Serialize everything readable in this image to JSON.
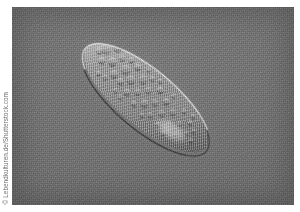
{
  "page": {
    "kind": "photograph",
    "background_color": "#ffffff",
    "width": 300,
    "height": 212
  },
  "attribution": {
    "text": "© Lebendkulturen.de/Shutterstock.com",
    "symbol": "©",
    "author": "Lebendkulturen.de",
    "agency": "Shutterstock.com",
    "orientation": "vertical-rotated-90-ccw",
    "color": "#6b6b6b",
    "position": "left-margin"
  },
  "photo": {
    "subject": "paramecium",
    "technique": "differential-interference-contrast-microscopy",
    "frame": {
      "x": 12,
      "y": 7,
      "width": 282,
      "height": 198
    },
    "background_color": "#6f6f6f",
    "highlight_color": "#ffffff",
    "shadow_color": "#141414",
    "organism": {
      "shape": "elongated-ellipse",
      "center_x": 146,
      "center_y": 98,
      "length": 156,
      "width": 56,
      "rotation_degrees": 40,
      "body_color": "#9a9a9a",
      "anterior": "upper-left-pointed",
      "posterior": "lower-right-rounded",
      "features": [
        "bright-membrane-rim-upper-left",
        "dark-membrane-rim-lower-right",
        "granular-cytoplasm",
        "numerous-vacuoles",
        "large-pale-food-vacuole"
      ]
    }
  },
  "vacuoles": [
    {
      "x": 16,
      "y": 16,
      "d": 9.5
    },
    {
      "x": 24,
      "y": 8,
      "d": 7.5
    },
    {
      "x": 29,
      "y": 22,
      "d": 8.5
    },
    {
      "x": 34,
      "y": 13,
      "d": 6.0
    },
    {
      "x": 38,
      "y": 30,
      "d": 7.0
    },
    {
      "x": 20,
      "y": 28,
      "d": 6.5
    },
    {
      "x": 44,
      "y": 19,
      "d": 9.0
    },
    {
      "x": 48,
      "y": 32,
      "d": 5.5
    },
    {
      "x": 52,
      "y": 10,
      "d": 6.5
    },
    {
      "x": 55,
      "y": 24,
      "d": 7.5
    },
    {
      "x": 60,
      "y": 36,
      "d": 6.0
    },
    {
      "x": 64,
      "y": 16,
      "d": 8.0
    },
    {
      "x": 68,
      "y": 29,
      "d": 5.5
    },
    {
      "x": 72,
      "y": 40,
      "d": 5.0
    },
    {
      "x": 75,
      "y": 21,
      "d": 6.5
    },
    {
      "x": 80,
      "y": 33,
      "d": 7.0
    },
    {
      "x": 84,
      "y": 13,
      "d": 5.5
    },
    {
      "x": 88,
      "y": 26,
      "d": 6.0
    },
    {
      "x": 92,
      "y": 38,
      "d": 5.0
    },
    {
      "x": 96,
      "y": 18,
      "d": 6.5
    },
    {
      "x": 100,
      "y": 30,
      "d": 5.5
    },
    {
      "x": 104,
      "y": 41,
      "d": 4.5
    },
    {
      "x": 108,
      "y": 22,
      "d": 5.5
    },
    {
      "x": 112,
      "y": 33,
      "d": 5.0
    },
    {
      "x": 116,
      "y": 14,
      "d": 4.5
    },
    {
      "x": 120,
      "y": 26,
      "d": 5.0
    },
    {
      "x": 124,
      "y": 37,
      "d": 4.5
    },
    {
      "x": 128,
      "y": 19,
      "d": 4.0
    },
    {
      "x": 132,
      "y": 29,
      "d": 4.5
    },
    {
      "x": 136,
      "y": 23,
      "d": 4.0
    },
    {
      "x": 140,
      "y": 32,
      "d": 3.5
    },
    {
      "x": 12,
      "y": 22,
      "d": 5.5
    },
    {
      "x": 42,
      "y": 8,
      "d": 5.0
    },
    {
      "x": 58,
      "y": 44,
      "d": 4.0
    },
    {
      "x": 70,
      "y": 9,
      "d": 5.0
    },
    {
      "x": 86,
      "y": 44,
      "d": 4.0
    },
    {
      "x": 98,
      "y": 9,
      "d": 4.5
    },
    {
      "x": 114,
      "y": 44,
      "d": 3.5
    },
    {
      "x": 126,
      "y": 12,
      "d": 3.5
    },
    {
      "x": 33,
      "y": 38,
      "d": 5.0
    },
    {
      "x": 50,
      "y": 42,
      "d": 4.5
    },
    {
      "x": 26,
      "y": 40,
      "d": 4.0
    },
    {
      "x": 62,
      "y": 5,
      "d": 4.0
    },
    {
      "x": 78,
      "y": 6,
      "d": 4.0
    }
  ]
}
